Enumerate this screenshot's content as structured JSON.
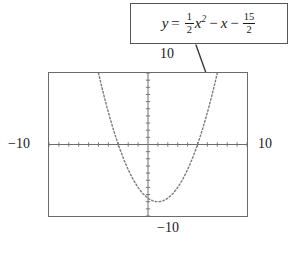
{
  "figure": {
    "name": "graphing-calculator-window-with-equation-callout",
    "background_color": "#ffffff",
    "frame_color": "#6a6b6f",
    "curve_color": "#7a7a7a",
    "axis_color": "#6e6e72",
    "text_color": "#1a1a1a"
  },
  "callout": {
    "name": "equation-callout",
    "equation_plain": "y = 1/2 x^2 - x - 15/2",
    "y": "y",
    "equals": "=",
    "coef_numerator": "1",
    "coef_denominator": "2",
    "x_term": "x",
    "exponent": "2",
    "minus_1": "−",
    "linear_term": "x",
    "minus_2": "−",
    "const_numerator": "15",
    "const_denominator": "2"
  },
  "window_labels": {
    "top": "10",
    "bottom": "−10",
    "left": "−10",
    "right": "10"
  },
  "chart_data": {
    "type": "line",
    "title": "",
    "subtitle": "",
    "xlabel": "",
    "ylabel": "",
    "equation": "y = (1/2)x^2 - x - 15/2",
    "function_form": "quadratic",
    "coefficients": {
      "a": 0.5,
      "b": -1,
      "c": -7.5
    },
    "vertex": [
      1,
      -8
    ],
    "x_intercepts": [
      -3,
      5
    ],
    "y_intercept": -7.5,
    "xlim": [
      -10,
      10
    ],
    "ylim": [
      -10,
      10
    ],
    "xtick_step": 1,
    "ytick_step": 1,
    "grid": false,
    "legend": "none",
    "curve_style": "dotted",
    "x": [
      -6,
      -5.5,
      -5,
      -4.5,
      -4,
      -3.5,
      -3,
      -2.5,
      -2,
      -1.5,
      -1,
      -0.5,
      0,
      0.5,
      1,
      1.5,
      2,
      2.5,
      3,
      3.5,
      4,
      4.5,
      5,
      5.5,
      6,
      6.5,
      7,
      7.5,
      8
    ],
    "values": [
      16.5,
      13.125,
      10,
      7.125,
      4.5,
      2.125,
      0,
      -1.875,
      -3.5,
      -4.875,
      -6,
      -6.875,
      -7.5,
      -7.875,
      -8,
      -7.875,
      -7.5,
      -6.875,
      -6,
      -4.875,
      -3.5,
      -1.875,
      0,
      2.125,
      4.5,
      7.125,
      10,
      13.125,
      16.5
    ],
    "annotations": [
      {
        "name": "equation-callout",
        "text": "y = (1/2)x^2 - x - 15/2",
        "points_to_curve_at_x": 5.9
      }
    ]
  }
}
